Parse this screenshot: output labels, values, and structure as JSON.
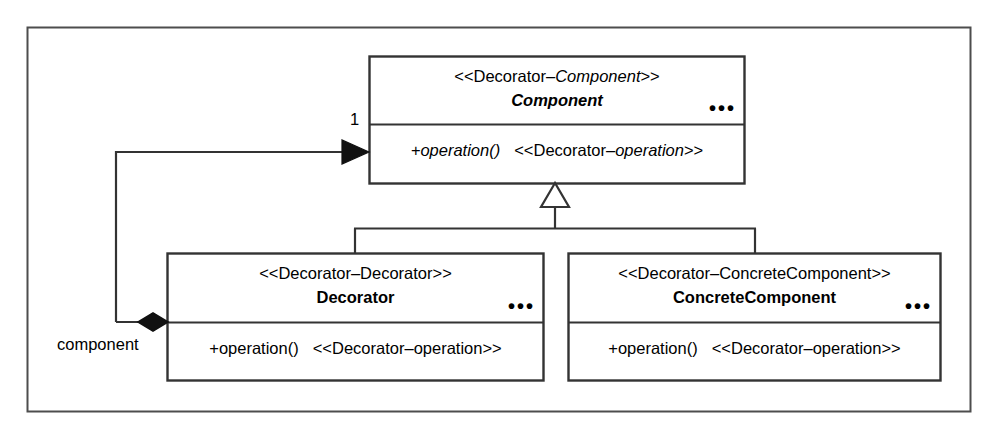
{
  "diagram": {
    "kind": "uml-class-diagram",
    "frame": {
      "stroke": "#4d4d4d",
      "fill": "#ffffff"
    },
    "line_color": "#333333",
    "text_color": "#000000",
    "ellipsis_glyph": "●●●"
  },
  "classes": {
    "component": {
      "stereotype_prefix": "<<Decorator–",
      "stereotype_italic": "Component",
      "stereotype_suffix": ">>",
      "name": "Component",
      "abstract": true,
      "ellipsis": "•••",
      "operation": "+operation()",
      "operation_italic": true,
      "operation_stereotype_prefix": "<<Decorator–",
      "operation_stereotype_italic": "operation",
      "operation_stereotype_suffix": ">>"
    },
    "decorator": {
      "stereotype_prefix": "<<Decorator–",
      "stereotype_italic": "Decorator",
      "stereotype_suffix": ">>",
      "name": "Decorator",
      "abstract": false,
      "ellipsis": "•••",
      "operation": "+operation()",
      "operation_italic": false,
      "operation_stereotype_prefix": "<<Decorator–",
      "operation_stereotype_italic": "operation",
      "operation_stereotype_suffix": ">>"
    },
    "concrete_component": {
      "stereotype_prefix": "<<Decorator–",
      "stereotype_italic": "ConcreteComponent",
      "stereotype_suffix": ">>",
      "name": "ConcreteComponent",
      "abstract": false,
      "ellipsis": "•••",
      "operation": "+operation()",
      "operation_italic": false,
      "operation_stereotype_prefix": "<<Decorator–",
      "operation_stereotype_italic": "operation",
      "operation_stereotype_suffix": ">>"
    }
  },
  "relationships": {
    "aggregation": {
      "type": "composition",
      "source": "Decorator",
      "target": "Component",
      "role_label": "component",
      "target_multiplicity": "1",
      "source_marker": "filled-diamond",
      "target_marker": "filled-arrow"
    },
    "generalization_decorator": {
      "type": "generalization",
      "source": "Decorator",
      "target": "Component",
      "target_marker": "hollow-triangle"
    },
    "generalization_concrete": {
      "type": "generalization",
      "source": "ConcreteComponent",
      "target": "Component",
      "target_marker": "hollow-triangle"
    }
  }
}
